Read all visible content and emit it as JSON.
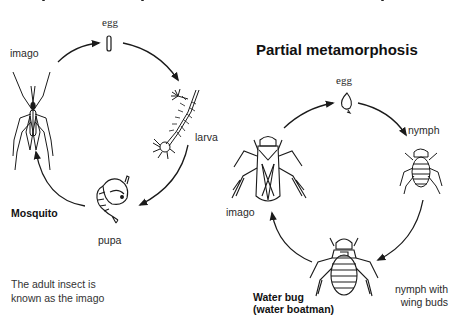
{
  "top_title_cutoff": "(title line cut off at top edge)",
  "complete_metamorphosis": {
    "organism_label": "Mosquito",
    "stages": {
      "egg": "egg",
      "larva": "larva",
      "pupa": "pupa",
      "imago": "imago"
    },
    "note_line1": "The adult insect is",
    "note_line2": "known as the imago"
  },
  "partial_metamorphosis": {
    "title": "Partial metamorphosis",
    "organism_label_line1": "Water bug",
    "organism_label_line2": "(water boatman)",
    "stages": {
      "egg": "egg",
      "nymph": "nymph",
      "nymph_wing_buds_line1": "nymph with",
      "nymph_wing_buds_line2": "wing buds",
      "imago": "imago"
    }
  },
  "colors": {
    "ink": "#1a1a1a",
    "background": "#ffffff"
  }
}
